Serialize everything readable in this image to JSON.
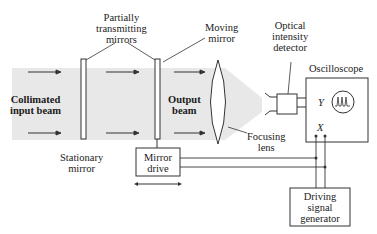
{
  "diagram": {
    "labels": {
      "partially_transmitting_mirrors": [
        "Partially",
        "transmitting",
        "mirrors"
      ],
      "moving_mirror": [
        "Moving",
        "mirror"
      ],
      "optical_intensity_detector": [
        "Optical",
        "intensity",
        "detector"
      ],
      "oscilloscope": "Oscilloscope",
      "collimated_input_beam": [
        "Collimated",
        "input beam"
      ],
      "output_beam": [
        "Output",
        "beam"
      ],
      "focusing_lens": [
        "Focusing",
        "lens"
      ],
      "stationary_mirror": [
        "Stationary",
        "mirror"
      ],
      "mirror_drive": [
        "Mirror",
        "drive"
      ],
      "driving_signal_generator": [
        "Driving",
        "signal",
        "generator"
      ],
      "y_input": "Y",
      "x_input": "X"
    },
    "colors": {
      "beam": "#e6e6e6",
      "line": "#333333",
      "text": "#222222"
    }
  }
}
